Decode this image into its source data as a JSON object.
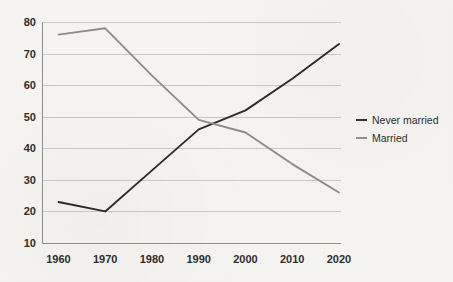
{
  "chart_data": {
    "type": "line",
    "title": "",
    "subtitle": "",
    "xlabel": "",
    "ylabel": "",
    "x": [
      1960,
      1970,
      1980,
      1990,
      2000,
      2010,
      2020
    ],
    "xticklabels": [
      "1960",
      "1970",
      "1980",
      "1990",
      "2000",
      "2010",
      "2020"
    ],
    "yticks": [
      10,
      20,
      30,
      40,
      50,
      60,
      70,
      80
    ],
    "yticklabels": [
      "10",
      "20",
      "30",
      "40",
      "50",
      "60",
      "70",
      "80"
    ],
    "ylim": [
      10,
      80
    ],
    "xlim": [
      1960,
      2020
    ],
    "grid": "horizontal",
    "legend_position": "right",
    "series": [
      {
        "name": "Never married",
        "color": "#2b2b2b",
        "values": [
          23,
          20,
          33,
          46,
          52,
          62,
          73
        ]
      },
      {
        "name": "Married",
        "color": "#8d8d8d",
        "values": [
          76,
          78,
          63,
          49,
          45,
          35,
          26
        ]
      }
    ]
  },
  "legend": {
    "items": [
      {
        "label": "Never married",
        "color": "#2b2b2b"
      },
      {
        "label": "Married",
        "color": "#8d8d8d"
      }
    ]
  },
  "colors": {
    "background": "#f6f4f0",
    "gridline": "#c9c9c9",
    "axis": "#8f8f8f",
    "text": "#2e2e2e",
    "never_married": "#2b2b2b",
    "married": "#8d8d8d"
  }
}
